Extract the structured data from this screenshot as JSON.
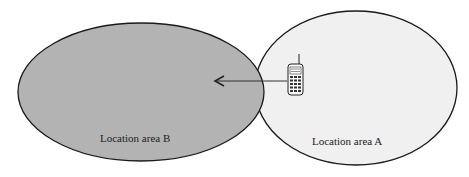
{
  "diagram": {
    "areas": [
      {
        "id": "B",
        "label": "Location area B",
        "fill": "#b3b3b3"
      },
      {
        "id": "A",
        "label": "Location area A",
        "fill": "#f0f0f0"
      }
    ],
    "stroke": "#1a1a1a",
    "arrow": {
      "from": "A",
      "to": "B",
      "color": "#333333"
    },
    "device": {
      "icon": "mobile-phone-icon"
    }
  }
}
